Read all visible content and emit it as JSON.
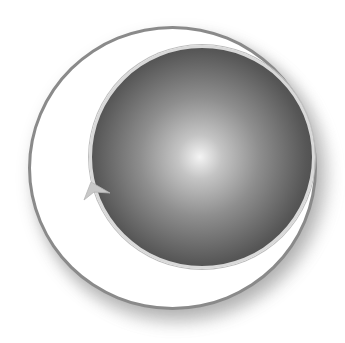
{
  "image": {
    "description": "Grayscale circular emblem: white ring with gray outline enclosing an offset dark glossy sphere, small arrow notch on left edge",
    "colors": {
      "background": "#ffffff",
      "ring_fill": "#ffffff",
      "ring_outline": "#8a8a8a",
      "sphere_highlight": "#f4f4f4",
      "sphere_dark": "#2e2e2e",
      "sphere_rim": "#d9d9d9",
      "arrow": "#c8c8c8"
    },
    "icons": {
      "ring": "ring-icon",
      "sphere": "sphere-icon",
      "arrow": "arrow-notch-icon"
    }
  }
}
